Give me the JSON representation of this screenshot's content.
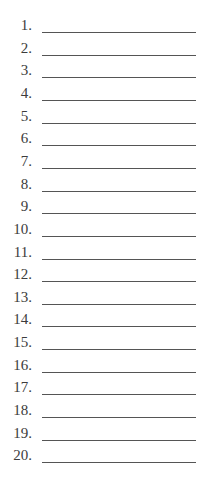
{
  "list": {
    "items": [
      {
        "label": "1."
      },
      {
        "label": "2."
      },
      {
        "label": "3."
      },
      {
        "label": "4."
      },
      {
        "label": "5."
      },
      {
        "label": "6."
      },
      {
        "label": "7."
      },
      {
        "label": "8."
      },
      {
        "label": "9."
      },
      {
        "label": "10."
      },
      {
        "label": "11."
      },
      {
        "label": "12."
      },
      {
        "label": "13."
      },
      {
        "label": "14."
      },
      {
        "label": "15."
      },
      {
        "label": "16."
      },
      {
        "label": "17."
      },
      {
        "label": "18."
      },
      {
        "label": "19."
      },
      {
        "label": "20."
      }
    ]
  }
}
